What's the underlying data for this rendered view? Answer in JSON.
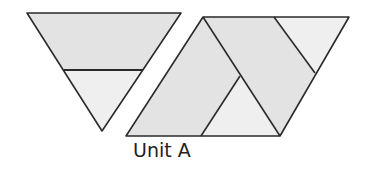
{
  "diagram": {
    "label": "Unit A",
    "colors": {
      "fill_dark": "#e3e3e3",
      "fill_light": "#efefef",
      "stroke": "#2a2a2a",
      "background": "#ffffff"
    },
    "shapes": [
      {
        "name": "inverted-triangle-top-trapezoid"
      },
      {
        "name": "inverted-triangle-bottom-triangle"
      },
      {
        "name": "parallelogram-left-piece"
      },
      {
        "name": "parallelogram-middle-band"
      },
      {
        "name": "parallelogram-bottom-triangle"
      },
      {
        "name": "parallelogram-right-triangle"
      }
    ]
  }
}
